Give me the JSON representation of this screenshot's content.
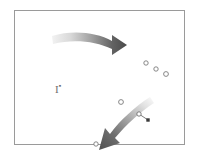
{
  "panel": {
    "name": "bounding-frame",
    "border_color": "#9a9a9a",
    "background_color": "#ffffff",
    "x": 14,
    "y": 10,
    "width": 171,
    "height": 135
  },
  "label": {
    "base_text": "I",
    "superscript_text": "▪",
    "color": "#6e6e6e"
  },
  "arrows": [
    {
      "name": "top-curved-arrow-right",
      "direction": "right",
      "color_start": "#e8e8e8",
      "color_end": "#4c4c4c",
      "tail_x": 52,
      "tail_y": 36,
      "head_x": 118,
      "head_y": 45
    },
    {
      "name": "bottom-curved-arrow-down-left",
      "direction": "down-left",
      "color_start": "#ececec",
      "color_end": "#5a5a5a",
      "tail_x": 147,
      "tail_y": 99,
      "head_x": 100,
      "head_y": 146
    }
  ],
  "markers": {
    "open_circles": [
      {
        "name": "circle-1",
        "cx": 146,
        "cy": 63,
        "r": 2.2
      },
      {
        "name": "circle-2",
        "cx": 156,
        "cy": 69,
        "r": 2.2
      },
      {
        "name": "circle-3",
        "cx": 166,
        "cy": 74,
        "r": 2.4
      },
      {
        "name": "circle-4",
        "cx": 121,
        "cy": 102,
        "r": 2.4
      },
      {
        "name": "circle-5",
        "cx": 139,
        "cy": 114,
        "r": 2.2
      },
      {
        "name": "circle-6",
        "cx": 96,
        "cy": 144,
        "r": 2.2
      }
    ],
    "filled_square": {
      "name": "filled-square-marker",
      "cx": 148,
      "cy": 120,
      "size": 3.4
    },
    "connector": {
      "name": "marker-connector-line",
      "x1": 139,
      "y1": 114,
      "x2": 148,
      "y2": 120
    },
    "stroke_color": "#7a7a7a",
    "fill_color": "#3a3a3a"
  }
}
